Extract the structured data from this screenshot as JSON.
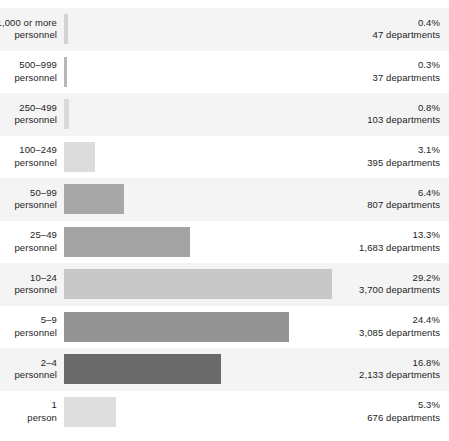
{
  "chart_data": {
    "type": "bar",
    "orientation": "horizontal",
    "title": "",
    "subtitle": "",
    "xlabel": "",
    "ylabel": "",
    "grid": false,
    "legend": "none",
    "xlim": [
      0,
      33
    ],
    "value_unit": "percent",
    "count_unit": "departments",
    "categories": [
      "1,000 or more personnel",
      "500–999 personnel",
      "250–499 personnel",
      "100–249 personnel",
      "50–99 personnel",
      "25–49 personnel",
      "10–24 personnel",
      "5–9 personnel",
      "2–4 personnel",
      "1 person"
    ],
    "values": [
      0.4,
      0.3,
      0.8,
      3.1,
      6.4,
      13.3,
      29.2,
      24.4,
      16.8,
      5.3
    ],
    "counts": [
      47,
      37,
      103,
      395,
      807,
      1683,
      3700,
      3085,
      2133,
      676
    ]
  },
  "colors": {
    "axis": "#6e6e6e",
    "band_background": "#f4f4f4",
    "plain_background": "#ffffff",
    "text": "#1d1d1d"
  },
  "rows": [
    {
      "label_line1": "1,000 or more",
      "label_line2": "personnel",
      "percent_text": "0.4%",
      "count_text": "47 departments",
      "bar_color": "#d2d2d2",
      "bar_width_px": 4,
      "band": true
    },
    {
      "label_line1": "500–999",
      "label_line2": "personnel",
      "percent_text": "0.3%",
      "count_text": "37 departments",
      "bar_color": "#b6b6b6",
      "bar_width_px": 3,
      "band": false
    },
    {
      "label_line1": "250–499",
      "label_line2": "personnel",
      "percent_text": "0.8%",
      "count_text": "103 departments",
      "bar_color": "#dadada",
      "bar_width_px": 5,
      "band": true
    },
    {
      "label_line1": "100–249",
      "label_line2": "personnel",
      "percent_text": "3.1%",
      "count_text": "395 departments",
      "bar_color": "#dcdcdc",
      "bar_width_px": 31,
      "band": false
    },
    {
      "label_line1": "50–99",
      "label_line2": "personnel",
      "percent_text": "6.4%",
      "count_text": "807 departments",
      "bar_color": "#a8a8a8",
      "bar_width_px": 60,
      "band": true
    },
    {
      "label_line1": "25–49",
      "label_line2": "personnel",
      "percent_text": "13.3%",
      "count_text": "1,683 departments",
      "bar_color": "#a3a3a3",
      "bar_width_px": 126,
      "band": false
    },
    {
      "label_line1": "10–24",
      "label_line2": "personnel",
      "percent_text": "29.2%",
      "count_text": "3,700 departments",
      "bar_color": "#c8c8c8",
      "bar_width_px": 268,
      "band": true
    },
    {
      "label_line1": "5–9",
      "label_line2": "personnel",
      "percent_text": "24.4%",
      "count_text": "3,085 departments",
      "bar_color": "#939393",
      "bar_width_px": 225,
      "band": false
    },
    {
      "label_line1": "2–4",
      "label_line2": "personnel",
      "percent_text": "16.8%",
      "count_text": "2,133 departments",
      "bar_color": "#6a6a6a",
      "bar_width_px": 157,
      "band": true
    },
    {
      "label_line1": "1",
      "label_line2": "person",
      "percent_text": "5.3%",
      "count_text": "676 departments",
      "bar_color": "#dedede",
      "bar_width_px": 52,
      "band": false
    }
  ]
}
